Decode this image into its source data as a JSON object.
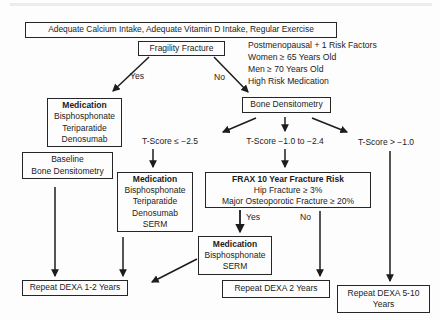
{
  "ink_color": "#1c1c1c",
  "border_color": "#262626",
  "background_color": "#fdfdfd",
  "nodes": {
    "guidance": {
      "label": "Adequate Calcium Intake, Adequate Vitamin D Intake, Regular Exercise"
    },
    "fragility": {
      "label": "Fragility Fracture"
    },
    "risk_factors": {
      "lines": [
        "Postmenopausal + 1 Risk Factors",
        "Women ≥ 65 Years Old",
        "Men ≥ 70 Years Old",
        "High Risk Medication"
      ]
    },
    "medication1": {
      "title": "Medication",
      "lines": [
        "Bisphosphonate",
        "Teriparatide",
        "Denosumab"
      ]
    },
    "bone_densitometry": {
      "label": "Bone Densitometry"
    },
    "baseline": {
      "lines": [
        "Baseline",
        "Bone Densitometry"
      ]
    },
    "tscore_low": {
      "label": "T-Score ≤ −2.5"
    },
    "tscore_mid": {
      "label": "T-Score −1.0 to −2.4"
    },
    "tscore_high": {
      "label": "T-Score > −1.0"
    },
    "medication2": {
      "title": "Medication",
      "lines": [
        "Bisphosphonate",
        "Teriparatide",
        "Denosumab",
        "SERM"
      ]
    },
    "frax": {
      "title": "FRAX 10 Year Fracture Risk",
      "lines": [
        "Hip Fracture ≥ 3%",
        "Major Osteoporotic Fracture ≥ 20%"
      ]
    },
    "medication3": {
      "title": "Medication",
      "lines": [
        "Bisphosphonate",
        "SERM"
      ]
    },
    "dexa_1_2": {
      "label": "Repeat DEXA 1-2 Years"
    },
    "dexa_2": {
      "label": "Repeat DEXA 2 Years"
    },
    "dexa_5_10": {
      "label": "Repeat DEXA 5-10 Years"
    }
  },
  "edges": {
    "fragility_yes": "Yes",
    "fragility_no": "No",
    "frax_yes": "Yes",
    "frax_no": "No"
  }
}
